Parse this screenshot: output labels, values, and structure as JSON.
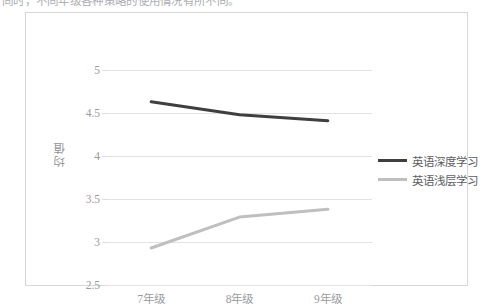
{
  "caption": {
    "text": "同时，不同年级各种策略的使用情况有所不同。"
  },
  "chart_data": {
    "type": "line",
    "title": "",
    "xlabel": "",
    "ylabel": "均值",
    "categories": [
      "7年级",
      "8年级",
      "9年级"
    ],
    "ylim": [
      2.5,
      5
    ],
    "ytick_labels": [
      "5",
      "4.5",
      "4",
      "3.5",
      "3",
      "2.5"
    ],
    "ytick_values": [
      5,
      4.5,
      4,
      3.5,
      3,
      2.5
    ],
    "grid": true,
    "legend_position": "right",
    "series": [
      {
        "name": "英语深度学习",
        "color": "#3f3f3f",
        "values": [
          4.63,
          4.48,
          4.41
        ]
      },
      {
        "name": "英语浅层学习",
        "color": "#bfbfbf",
        "values": [
          2.93,
          3.29,
          3.38
        ]
      }
    ]
  },
  "colors": {
    "frame_border": "#d6d6da",
    "gridline": "#e2e2e6",
    "tick_text": "#9a9aa0",
    "legend_text": "#5d5d63"
  }
}
